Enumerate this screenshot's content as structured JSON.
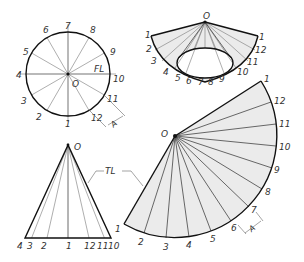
{
  "figure": {
    "type": "cone-surface-development",
    "views": {
      "top_view": {
        "center_label": "O",
        "element_labels": [
          "1",
          "2",
          "3",
          "4",
          "5",
          "6",
          "7",
          "8",
          "9",
          "10",
          "11",
          "12"
        ],
        "fl_label": "FL",
        "dimension_label": "A"
      },
      "rolled_view": {
        "apex_label": "O",
        "left_labels": [
          "1",
          "2",
          "3",
          "4",
          "5",
          "6",
          "7",
          "8",
          "9"
        ],
        "right_labels": [
          "1",
          "12",
          "11",
          "10"
        ]
      },
      "front_view": {
        "apex_label": "O",
        "base_labels": [
          "4",
          "3",
          "2",
          "1",
          "12",
          "11",
          "10"
        ],
        "tl_label": "TL"
      },
      "development": {
        "apex_label": "O",
        "arc_labels": [
          "1",
          "12",
          "11",
          "10",
          "9",
          "8",
          "7",
          "6",
          "5",
          "4",
          "3",
          "2",
          "1"
        ],
        "dimension_label": "A"
      }
    },
    "colors": {
      "line": "#111111",
      "thin_line": "#777777",
      "shade": "#ebebeb",
      "text": "#333333"
    }
  }
}
